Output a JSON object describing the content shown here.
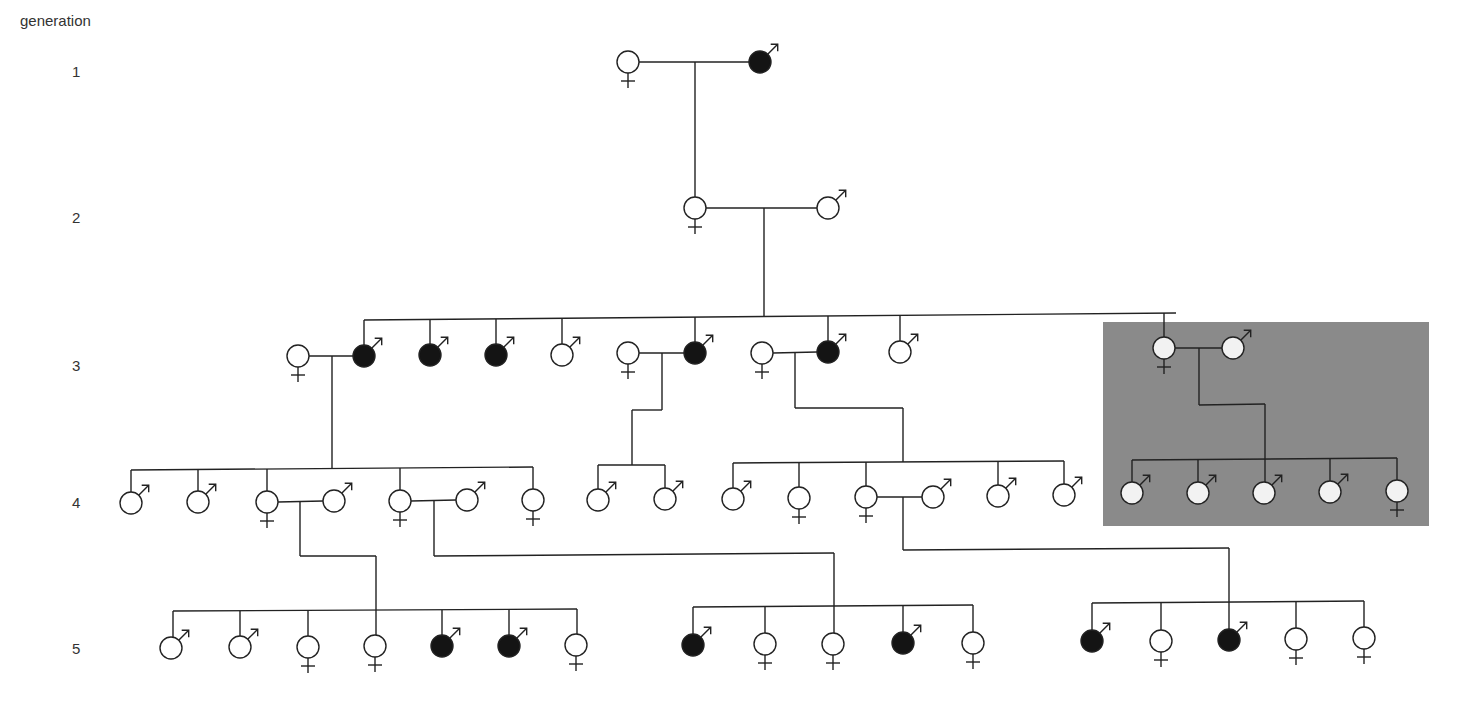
{
  "title": "generation",
  "generation_labels": [
    {
      "label": "1",
      "y": 72
    },
    {
      "label": "2",
      "y": 218
    },
    {
      "label": "3",
      "y": 366
    },
    {
      "label": "4",
      "y": 503
    },
    {
      "label": "5",
      "y": 649
    }
  ],
  "colors": {
    "line": "#222222",
    "affected_fill": "#141414",
    "unaffected_fill": "#ffffff",
    "highlight_box": "#8a8a8a",
    "highlight_member_fill": "#f2f2f2"
  },
  "highlight_box": {
    "x": 1103,
    "y": 322,
    "width": 326,
    "height": 204,
    "label": "highlighted family branch"
  },
  "individuals": [
    {
      "id": "g1-f1",
      "gen": 1,
      "sex": "female",
      "affected": false,
      "x": 628,
      "y": 62
    },
    {
      "id": "g1-m1",
      "gen": 1,
      "sex": "male",
      "affected": true,
      "x": 760,
      "y": 62
    },
    {
      "id": "g2-f1",
      "gen": 2,
      "sex": "female",
      "affected": false,
      "x": 695,
      "y": 208
    },
    {
      "id": "g2-m1",
      "gen": 2,
      "sex": "male",
      "affected": false,
      "x": 828,
      "y": 208
    },
    {
      "id": "g3-f1",
      "gen": 3,
      "sex": "female",
      "affected": false,
      "x": 298,
      "y": 356
    },
    {
      "id": "g3-m1",
      "gen": 3,
      "sex": "male",
      "affected": true,
      "x": 364,
      "y": 356
    },
    {
      "id": "g3-m2",
      "gen": 3,
      "sex": "male",
      "affected": true,
      "x": 430,
      "y": 355
    },
    {
      "id": "g3-m3",
      "gen": 3,
      "sex": "male",
      "affected": true,
      "x": 496,
      "y": 355
    },
    {
      "id": "g3-m4",
      "gen": 3,
      "sex": "male",
      "affected": false,
      "x": 562,
      "y": 355
    },
    {
      "id": "g3-f2",
      "gen": 3,
      "sex": "female",
      "affected": false,
      "x": 628,
      "y": 353
    },
    {
      "id": "g3-m5",
      "gen": 3,
      "sex": "male",
      "affected": true,
      "x": 695,
      "y": 353
    },
    {
      "id": "g3-f3",
      "gen": 3,
      "sex": "female",
      "affected": false,
      "x": 762,
      "y": 353
    },
    {
      "id": "g3-m6",
      "gen": 3,
      "sex": "male",
      "affected": true,
      "x": 828,
      "y": 352
    },
    {
      "id": "g3-m7",
      "gen": 3,
      "sex": "male",
      "affected": false,
      "x": 900,
      "y": 352
    },
    {
      "id": "g3-f4",
      "gen": 3,
      "sex": "female",
      "affected": false,
      "x": 1164,
      "y": 348,
      "highlighted": true
    },
    {
      "id": "g3-m8",
      "gen": 3,
      "sex": "male",
      "affected": false,
      "x": 1233,
      "y": 348,
      "highlighted": true
    },
    {
      "id": "g4-m1",
      "gen": 4,
      "sex": "male",
      "affected": false,
      "x": 131,
      "y": 503
    },
    {
      "id": "g4-m2",
      "gen": 4,
      "sex": "male",
      "affected": false,
      "x": 198,
      "y": 502
    },
    {
      "id": "g4-f1",
      "gen": 4,
      "sex": "female",
      "affected": false,
      "x": 267,
      "y": 502
    },
    {
      "id": "g4-m3",
      "gen": 4,
      "sex": "male",
      "affected": false,
      "x": 334,
      "y": 501
    },
    {
      "id": "g4-f2",
      "gen": 4,
      "sex": "female",
      "affected": false,
      "x": 400,
      "y": 501
    },
    {
      "id": "g4-m4",
      "gen": 4,
      "sex": "male",
      "affected": false,
      "x": 467,
      "y": 500
    },
    {
      "id": "g4-f3",
      "gen": 4,
      "sex": "female",
      "affected": false,
      "x": 533,
      "y": 500
    },
    {
      "id": "g4-m5",
      "gen": 4,
      "sex": "male",
      "affected": false,
      "x": 598,
      "y": 500
    },
    {
      "id": "g4-m6",
      "gen": 4,
      "sex": "male",
      "affected": false,
      "x": 665,
      "y": 499
    },
    {
      "id": "g4-m7",
      "gen": 4,
      "sex": "male",
      "affected": false,
      "x": 733,
      "y": 499
    },
    {
      "id": "g4-f4",
      "gen": 4,
      "sex": "female",
      "affected": false,
      "x": 799,
      "y": 498
    },
    {
      "id": "g4-f5",
      "gen": 4,
      "sex": "female",
      "affected": false,
      "x": 866,
      "y": 497
    },
    {
      "id": "g4-m8",
      "gen": 4,
      "sex": "male",
      "affected": false,
      "x": 933,
      "y": 497
    },
    {
      "id": "g4-m9",
      "gen": 4,
      "sex": "male",
      "affected": false,
      "x": 998,
      "y": 496
    },
    {
      "id": "g4-m10",
      "gen": 4,
      "sex": "male",
      "affected": false,
      "x": 1064,
      "y": 495
    },
    {
      "id": "g4-m11",
      "gen": 4,
      "sex": "male",
      "affected": false,
      "x": 1132,
      "y": 493,
      "highlighted": true
    },
    {
      "id": "g4-m12",
      "gen": 4,
      "sex": "male",
      "affected": false,
      "x": 1198,
      "y": 493,
      "highlighted": true
    },
    {
      "id": "g4-m13",
      "gen": 4,
      "sex": "male",
      "affected": false,
      "x": 1264,
      "y": 493,
      "highlighted": true
    },
    {
      "id": "g4-m14",
      "gen": 4,
      "sex": "male",
      "affected": false,
      "x": 1330,
      "y": 492,
      "highlighted": true
    },
    {
      "id": "g4-f6",
      "gen": 4,
      "sex": "female",
      "affected": false,
      "x": 1397,
      "y": 491,
      "highlighted": true
    },
    {
      "id": "g5-m1",
      "gen": 5,
      "sex": "male",
      "affected": false,
      "x": 171,
      "y": 648
    },
    {
      "id": "g5-m2",
      "gen": 5,
      "sex": "male",
      "affected": false,
      "x": 240,
      "y": 647
    },
    {
      "id": "g5-f1",
      "gen": 5,
      "sex": "female",
      "affected": false,
      "x": 308,
      "y": 647
    },
    {
      "id": "g5-f2",
      "gen": 5,
      "sex": "female",
      "affected": false,
      "x": 375,
      "y": 646
    },
    {
      "id": "g5-m3",
      "gen": 5,
      "sex": "male",
      "affected": true,
      "x": 442,
      "y": 646
    },
    {
      "id": "g5-m4",
      "gen": 5,
      "sex": "male",
      "affected": true,
      "x": 509,
      "y": 646
    },
    {
      "id": "g5-f3",
      "gen": 5,
      "sex": "female",
      "affected": false,
      "x": 576,
      "y": 645
    },
    {
      "id": "g5-m5",
      "gen": 5,
      "sex": "male",
      "affected": true,
      "x": 693,
      "y": 645
    },
    {
      "id": "g5-f4",
      "gen": 5,
      "sex": "female",
      "affected": false,
      "x": 765,
      "y": 644
    },
    {
      "id": "g5-f5",
      "gen": 5,
      "sex": "female",
      "affected": false,
      "x": 833,
      "y": 644
    },
    {
      "id": "g5-m6",
      "gen": 5,
      "sex": "male",
      "affected": true,
      "x": 903,
      "y": 643
    },
    {
      "id": "g5-f6",
      "gen": 5,
      "sex": "female",
      "affected": false,
      "x": 973,
      "y": 643
    },
    {
      "id": "g5-m7",
      "gen": 5,
      "sex": "male",
      "affected": true,
      "x": 1092,
      "y": 641
    },
    {
      "id": "g5-f7",
      "gen": 5,
      "sex": "female",
      "affected": false,
      "x": 1161,
      "y": 641
    },
    {
      "id": "g5-m8",
      "gen": 5,
      "sex": "male",
      "affected": true,
      "x": 1229,
      "y": 640
    },
    {
      "id": "g5-f8",
      "gen": 5,
      "sex": "female",
      "affected": false,
      "x": 1296,
      "y": 639
    },
    {
      "id": "g5-f9",
      "gen": 5,
      "sex": "female",
      "affected": false,
      "x": 1364,
      "y": 638
    }
  ],
  "lines": [
    [
      639,
      62,
      749,
      62
    ],
    [
      695,
      62,
      695,
      197
    ],
    [
      706,
      208,
      817,
      208
    ],
    [
      764,
      208,
      764,
      316
    ],
    [
      364,
      320,
      1176,
      313
    ],
    [
      364,
      320,
      364,
      345
    ],
    [
      430,
      320,
      430,
      344
    ],
    [
      496,
      319,
      496,
      344
    ],
    [
      562,
      319,
      562,
      344
    ],
    [
      695,
      317,
      695,
      342
    ],
    [
      828,
      316,
      828,
      341
    ],
    [
      900,
      315,
      900,
      341
    ],
    [
      1164,
      313,
      1164,
      337
    ],
    [
      309,
      356,
      353,
      356
    ],
    [
      332,
      356,
      332,
      468
    ],
    [
      131,
      470,
      533,
      467
    ],
    [
      131,
      470,
      131,
      492
    ],
    [
      198,
      470,
      198,
      491
    ],
    [
      267,
      469,
      267,
      491
    ],
    [
      400,
      468,
      400,
      490
    ],
    [
      533,
      467,
      533,
      489
    ],
    [
      639,
      353,
      684,
      353
    ],
    [
      662,
      353,
      662,
      410
    ],
    [
      632,
      410,
      662,
      410
    ],
    [
      632,
      410,
      632,
      465
    ],
    [
      598,
      465,
      665,
      465
    ],
    [
      598,
      465,
      598,
      489
    ],
    [
      665,
      465,
      665,
      488
    ],
    [
      773,
      353,
      817,
      352
    ],
    [
      795,
      353,
      795,
      408
    ],
    [
      795,
      408,
      903,
      408
    ],
    [
      903,
      408,
      903,
      462
    ],
    [
      733,
      463,
      1064,
      461
    ],
    [
      733,
      463,
      733,
      488
    ],
    [
      799,
      463,
      799,
      487
    ],
    [
      866,
      462,
      866,
      486
    ],
    [
      998,
      461,
      998,
      485
    ],
    [
      1064,
      461,
      1064,
      484
    ],
    [
      1175,
      348,
      1222,
      348
    ],
    [
      1199,
      348,
      1199,
      405
    ],
    [
      1199,
      405,
      1265,
      404
    ],
    [
      1265,
      404,
      1265,
      459
    ],
    [
      1132,
      460,
      1397,
      458
    ],
    [
      1132,
      460,
      1132,
      482
    ],
    [
      1198,
      459,
      1198,
      482
    ],
    [
      1265,
      459,
      1265,
      482
    ],
    [
      1330,
      459,
      1330,
      481
    ],
    [
      1397,
      458,
      1397,
      480
    ],
    [
      278,
      502,
      323,
      501
    ],
    [
      300,
      502,
      300,
      556
    ],
    [
      300,
      556,
      376,
      556
    ],
    [
      376,
      556,
      376,
      610
    ],
    [
      173,
      611,
      577,
      609
    ],
    [
      173,
      611,
      173,
      637
    ],
    [
      240,
      611,
      240,
      636
    ],
    [
      308,
      611,
      308,
      636
    ],
    [
      376,
      610,
      376,
      635
    ],
    [
      442,
      610,
      442,
      635
    ],
    [
      509,
      610,
      509,
      635
    ],
    [
      577,
      609,
      577,
      634
    ],
    [
      411,
      501,
      456,
      500
    ],
    [
      434,
      501,
      434,
      556
    ],
    [
      434,
      556,
      834,
      553
    ],
    [
      834,
      553,
      834,
      606
    ],
    [
      693,
      607,
      973,
      605
    ],
    [
      693,
      607,
      693,
      634
    ],
    [
      765,
      606,
      765,
      633
    ],
    [
      834,
      606,
      834,
      633
    ],
    [
      903,
      605,
      903,
      632
    ],
    [
      973,
      605,
      973,
      632
    ],
    [
      877,
      497,
      922,
      497
    ],
    [
      903,
      497,
      903,
      550
    ],
    [
      903,
      550,
      1229,
      548
    ],
    [
      1229,
      548,
      1229,
      602
    ],
    [
      1092,
      603,
      1364,
      601
    ],
    [
      1092,
      603,
      1092,
      630
    ],
    [
      1161,
      603,
      1161,
      630
    ],
    [
      1229,
      602,
      1229,
      629
    ],
    [
      1296,
      602,
      1296,
      628
    ],
    [
      1364,
      601,
      1364,
      627
    ]
  ]
}
